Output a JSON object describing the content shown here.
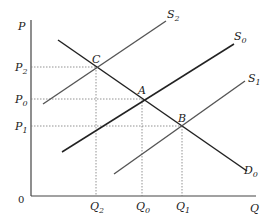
{
  "diagram": {
    "type": "supply-demand",
    "axes": {
      "y_label": "P",
      "x_label": "Q",
      "origin_label": "0"
    },
    "price_ticks": [
      {
        "base": "P",
        "sub": "2"
      },
      {
        "base": "P",
        "sub": "0"
      },
      {
        "base": "P",
        "sub": "1"
      }
    ],
    "quantity_ticks": [
      {
        "base": "Q",
        "sub": "2"
      },
      {
        "base": "Q",
        "sub": "0"
      },
      {
        "base": "Q",
        "sub": "1"
      }
    ],
    "curves": [
      {
        "base": "S",
        "sub": "2"
      },
      {
        "base": "S",
        "sub": "0"
      },
      {
        "base": "S",
        "sub": "1"
      },
      {
        "base": "D",
        "sub": "0"
      }
    ],
    "points": [
      "C",
      "A",
      "B"
    ],
    "colors": {
      "line": "#222222",
      "guide": "#666666",
      "axis": "#444444"
    }
  }
}
